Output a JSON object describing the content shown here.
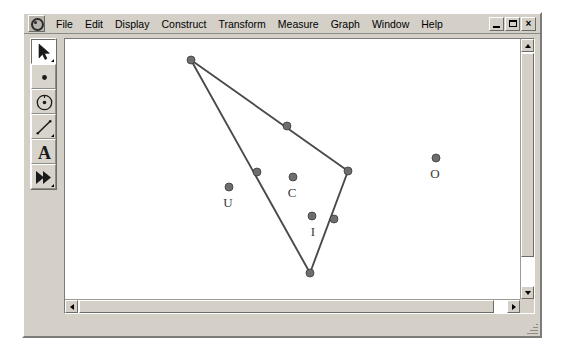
{
  "window": {
    "app_icon_name": "sketchpad-app-icon",
    "menu_items": [
      "File",
      "Edit",
      "Display",
      "Construct",
      "Transform",
      "Measure",
      "Graph",
      "Window",
      "Help"
    ],
    "controls": {
      "minimize_label": "_",
      "restore_label": "❐",
      "close_label": "×"
    }
  },
  "toolbar": {
    "tools": [
      {
        "name": "selection-arrow-tool",
        "icon": "arrow-icon",
        "selected": true,
        "has_popup": true
      },
      {
        "name": "point-tool",
        "icon": "point-icon",
        "selected": false,
        "has_popup": false
      },
      {
        "name": "compass-circle-tool",
        "icon": "circle-icon",
        "selected": false,
        "has_popup": false
      },
      {
        "name": "straightedge-tool",
        "icon": "line-segment-icon",
        "selected": false,
        "has_popup": true
      },
      {
        "name": "text-tool",
        "icon": "letter-a-icon",
        "label": "A",
        "selected": false,
        "has_popup": false
      },
      {
        "name": "custom-transform-tool",
        "icon": "double-arrow-icon",
        "selected": false,
        "has_popup": true
      }
    ]
  },
  "canvas": {
    "geometry": {
      "stroke_color": "#4a4a4a",
      "point_fill": "#6e6e6e",
      "point_radius": 4.0,
      "triangle": {
        "name": "triangle",
        "vertices": [
          {
            "name": "vertex-top",
            "x": 126,
            "y": 21
          },
          {
            "name": "vertex-right",
            "x": 283,
            "y": 132
          },
          {
            "name": "vertex-bottom",
            "x": 245,
            "y": 234
          }
        ]
      },
      "midpoints": [
        {
          "name": "midpoint-top-right",
          "x": 222,
          "y": 87
        },
        {
          "name": "midpoint-left",
          "x": 192,
          "y": 133
        },
        {
          "name": "midpoint-bottom-right",
          "x": 269,
          "y": 180
        }
      ],
      "free_points": [
        {
          "name": "point-u",
          "label": "U",
          "x": 164,
          "y": 148,
          "label_x": 163,
          "label_y": 168
        },
        {
          "name": "point-c",
          "label": "C",
          "x": 228,
          "y": 138,
          "label_x": 227,
          "label_y": 158
        },
        {
          "name": "point-i",
          "label": "I",
          "x": 247,
          "y": 177,
          "label_x": 248,
          "label_y": 197
        },
        {
          "name": "point-o",
          "label": "O",
          "x": 371,
          "y": 119,
          "label_x": 370,
          "label_y": 139
        }
      ]
    }
  },
  "scrollbars": {
    "vertical": {
      "up_arrow": "scroll-up-arrow",
      "down_arrow": "scroll-down-arrow"
    },
    "horizontal": {
      "left_arrow": "scroll-left-arrow",
      "right_arrow": "scroll-right-arrow"
    }
  },
  "colors": {
    "window_face": "#d4d0c8",
    "canvas_background": "#ffffff",
    "geometry_stroke": "#4a4a4a",
    "menu_text": "#000000"
  }
}
